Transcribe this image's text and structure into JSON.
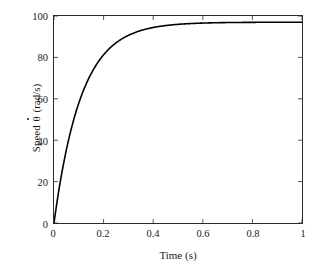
{
  "chart_data": {
    "type": "line",
    "title": "",
    "xlabel": "Time (s)",
    "ylabel_text": "Speed",
    "ylabel_symbol": "θ",
    "ylabel_units": "(rad/s)",
    "ylabel_full": "Speed θ̇ (rad/s)",
    "xlim": [
      0,
      1
    ],
    "ylim": [
      0,
      100
    ],
    "xticks": [
      "0",
      "0.2",
      "0.4",
      "0.6",
      "0.8",
      "1"
    ],
    "xtick_values": [
      0,
      0.2,
      0.4,
      0.6,
      0.8,
      1
    ],
    "yticks": [
      "0",
      "20",
      "40",
      "60",
      "80",
      "100"
    ],
    "ytick_values": [
      0,
      20,
      40,
      60,
      80,
      100
    ],
    "grid": false,
    "legend": null,
    "series": [
      {
        "name": "Speed response",
        "color": "#000000",
        "line_width": 1.6,
        "x": [
          0,
          0.01,
          0.02,
          0.03,
          0.04,
          0.05,
          0.06,
          0.07,
          0.08,
          0.09,
          0.1,
          0.12,
          0.14,
          0.16,
          0.18,
          0.2,
          0.22,
          0.24,
          0.26,
          0.28,
          0.3,
          0.32,
          0.34,
          0.36,
          0.38,
          0.4,
          0.45,
          0.5,
          0.55,
          0.6,
          0.65,
          0.7,
          0.75,
          0.8,
          0.85,
          0.9,
          0.95,
          1.0
        ],
        "y": [
          0.0,
          8.4,
          16.2,
          23.3,
          29.8,
          35.7,
          41.2,
          46.2,
          50.8,
          55.0,
          58.8,
          65.5,
          71.1,
          75.8,
          79.8,
          83.1,
          85.9,
          88.3,
          90.3,
          92.0,
          93.4,
          94.6,
          95.6,
          96.5,
          97.2,
          97.8,
          98.8,
          99.4,
          99.7,
          99.9,
          100.0,
          100.0,
          100.0,
          100.0,
          100.0,
          100.0,
          100.0,
          100.0
        ],
        "model": "97 * (1 - exp(-t / 0.11))",
        "asymptote": 97
      }
    ]
  },
  "figure": {
    "background": "#ffffff",
    "axis_color": "#2b2b2b",
    "text_color": "#1a1a1a"
  }
}
